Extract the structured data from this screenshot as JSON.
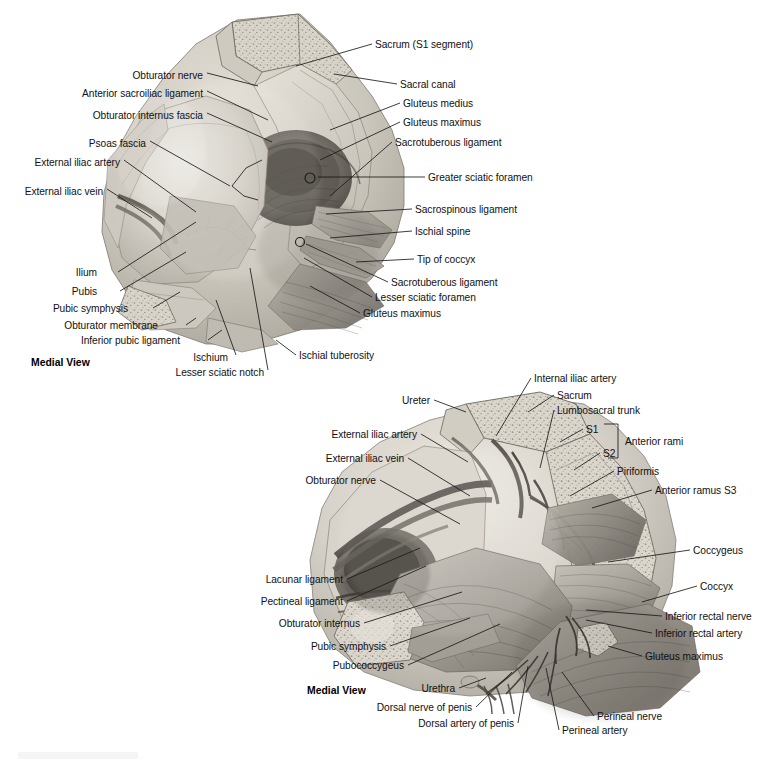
{
  "page": {
    "background_color": "#ffffff",
    "text_color": "#111111",
    "width": 759,
    "height": 765
  },
  "figures": [
    {
      "id": "figure-top",
      "view_label": "Medial View",
      "subject": "Hemipelvis, medial view with sacrotuberous and sacrospinous ligaments",
      "labels_left": [
        {
          "text": "Obturator nerve",
          "x": 203,
          "y": 75
        },
        {
          "text": "Anterior sacroiliac ligament",
          "x": 203,
          "y": 93
        },
        {
          "text": "Obturator internus fascia",
          "x": 203,
          "y": 115
        },
        {
          "text": "Psoas fascia",
          "x": 146,
          "y": 143
        },
        {
          "text": "External iliac artery",
          "x": 120,
          "y": 162
        },
        {
          "text": "External iliac vein",
          "x": 103,
          "y": 191
        },
        {
          "text": "Ilium",
          "x": 97,
          "y": 272
        },
        {
          "text": "Pubis",
          "x": 97,
          "y": 291
        },
        {
          "text": "Pubic symphysis",
          "x": 128,
          "y": 308
        },
        {
          "text": "Obturator membrane",
          "x": 158,
          "y": 325
        },
        {
          "text": "Inferior pubic ligament",
          "x": 180,
          "y": 340
        },
        {
          "text": "Ischium",
          "x": 228,
          "y": 357
        },
        {
          "text": "Lesser sciatic notch",
          "x": 264,
          "y": 372
        }
      ],
      "labels_right": [
        {
          "text": "Sacrum (S1 segment)",
          "x": 375,
          "y": 44
        },
        {
          "text": "Sacral canal",
          "x": 400,
          "y": 84
        },
        {
          "text": "Gluteus medius",
          "x": 403,
          "y": 103
        },
        {
          "text": "Gluteus maximus",
          "x": 403,
          "y": 122
        },
        {
          "text": "Sacrotuberous ligament",
          "x": 395,
          "y": 142
        },
        {
          "text": "Greater sciatic foramen",
          "x": 428,
          "y": 177
        },
        {
          "text": "Sacrospinous ligament",
          "x": 415,
          "y": 209
        },
        {
          "text": "Ischial spine",
          "x": 415,
          "y": 231
        },
        {
          "text": "Tip of coccyx",
          "x": 417,
          "y": 259
        },
        {
          "text": "Sacrotuberous ligament",
          "x": 391,
          "y": 282
        },
        {
          "text": "Lesser sciatic foramen",
          "x": 375,
          "y": 297
        },
        {
          "text": "Gluteus maximus",
          "x": 363,
          "y": 313
        },
        {
          "text": "Ischial tuberosity",
          "x": 299,
          "y": 355
        }
      ],
      "view_label_pos": {
        "x": 31,
        "y": 362
      }
    },
    {
      "id": "figure-bottom",
      "view_label": "Medial View",
      "subject": "Hemipelvis, medial view with sacral plexus, pelvic floor and perineal neurovasculature",
      "labels_left": [
        {
          "text": "Ureter",
          "x": 430,
          "y": 400
        },
        {
          "text": "External iliac artery",
          "x": 417,
          "y": 434
        },
        {
          "text": "External iliac vein",
          "x": 404,
          "y": 458
        },
        {
          "text": "Obturator nerve",
          "x": 376,
          "y": 480
        },
        {
          "text": "Lacunar ligament",
          "x": 343,
          "y": 579
        },
        {
          "text": "Pectineal ligament",
          "x": 343,
          "y": 601
        },
        {
          "text": "Obturator internus",
          "x": 360,
          "y": 623
        },
        {
          "text": "Pubic symphysis",
          "x": 386,
          "y": 646
        },
        {
          "text": "Pubococcygeus",
          "x": 404,
          "y": 665
        },
        {
          "text": "Urethra",
          "x": 455,
          "y": 688
        },
        {
          "text": "Dorsal nerve of penis",
          "x": 472,
          "y": 707
        },
        {
          "text": "Dorsal artery of penis",
          "x": 514,
          "y": 723
        }
      ],
      "labels_right": [
        {
          "text": "Internal iliac artery",
          "x": 534,
          "y": 378
        },
        {
          "text": "Sacrum",
          "x": 557,
          "y": 395
        },
        {
          "text": "Lumbosacral trunk",
          "x": 557,
          "y": 410
        },
        {
          "text": "Piriformis",
          "x": 617,
          "y": 471
        },
        {
          "text": "Anterior ramus S3",
          "x": 655,
          "y": 490
        },
        {
          "text": "Coccygeus",
          "x": 693,
          "y": 550
        },
        {
          "text": "Coccyx",
          "x": 700,
          "y": 586
        },
        {
          "text": "Inferior rectal nerve",
          "x": 665,
          "y": 616
        },
        {
          "text": "Inferior rectal artery",
          "x": 655,
          "y": 633
        },
        {
          "text": "Gluteus maximus",
          "x": 645,
          "y": 656
        },
        {
          "text": "Perineal nerve",
          "x": 597,
          "y": 716
        },
        {
          "text": "Perineal artery",
          "x": 562,
          "y": 730
        }
      ],
      "bracket": {
        "s1_label": "S1",
        "s2_label": "S2",
        "group_label": "Anterior rami",
        "s1_pos": {
          "x": 586,
          "y": 429
        },
        "s2_pos": {
          "x": 603,
          "y": 453
        },
        "group_pos": {
          "x": 625,
          "y": 441
        }
      },
      "view_label_pos": {
        "x": 307,
        "y": 690
      }
    }
  ]
}
